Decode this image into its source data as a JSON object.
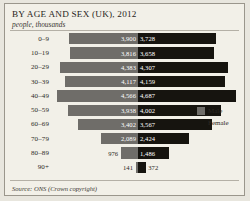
{
  "header": {
    "title": "BY AGE AND SEX (UK), 2012",
    "subtitle": "people, thousands"
  },
  "legend": {
    "male_label": "Male",
    "female_label": "Female",
    "male_color": "#6f6d69",
    "female_color": "#16140f"
  },
  "footer": {
    "source_prefix": "Source:",
    "source_text": "ONS (Crown copyright)"
  },
  "chart_data": {
    "type": "bar",
    "orientation": "horizontal-diverging",
    "title": "BY AGE AND SEX (UK), 2012",
    "subtitle": "people, thousands",
    "xlabel": "",
    "ylabel": "",
    "categories": [
      "0–9",
      "10–19",
      "20–29",
      "30–39",
      "40–49",
      "50–59",
      "60–69",
      "70–79",
      "80–89",
      "90+"
    ],
    "series": [
      {
        "name": "Male",
        "color": "#6f6d69",
        "direction": "left",
        "values": [
          3900,
          3816,
          4383,
          4117,
          4566,
          3938,
          3402,
          2089,
          976,
          141
        ],
        "labels": [
          "3,900",
          "3,816",
          "4,383",
          "4,117",
          "4,566",
          "3,938",
          "3,402",
          "2,089",
          "976",
          "141"
        ]
      },
      {
        "name": "Female",
        "color": "#16140f",
        "direction": "right",
        "values": [
          3728,
          3658,
          4307,
          4159,
          4687,
          4002,
          3567,
          2424,
          1486,
          372
        ],
        "labels": [
          "3,728",
          "3,658",
          "4,307",
          "4,159",
          "4,687",
          "4,002",
          "3,567",
          "2,424",
          "1,486",
          "372"
        ]
      }
    ],
    "xlim": [
      0,
      4800
    ],
    "grid": false,
    "legend_position": "right-middle",
    "source": "Source: ONS (Crown copyright)"
  }
}
